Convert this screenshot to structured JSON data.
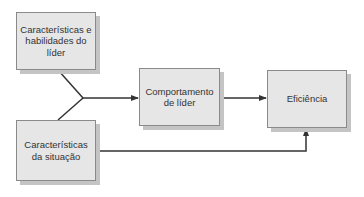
{
  "diagram": {
    "boxes": [
      {
        "id": "leader-traits",
        "label": "Características e habilidades do líder"
      },
      {
        "id": "situation",
        "label": "Características da situação"
      },
      {
        "id": "leader-behavior",
        "label": "Comportamento de líder"
      },
      {
        "id": "effectiveness",
        "label": "Eficiência"
      }
    ],
    "edges": [
      {
        "from": "leader-traits",
        "to": "leader-behavior"
      },
      {
        "from": "situation",
        "to": "leader-behavior"
      },
      {
        "from": "leader-behavior",
        "to": "effectiveness"
      },
      {
        "from": "situation",
        "to": "effectiveness"
      }
    ],
    "colors": {
      "box_fill": "#e6e6e6",
      "box_border": "#8a8a8a",
      "shadow": "#c4c4c4",
      "line": "#333333"
    }
  }
}
